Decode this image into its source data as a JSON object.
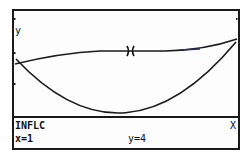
{
  "screen": {
    "axis_labels": {
      "y": "y",
      "x": "X"
    },
    "mode_label": "INFLC",
    "readout": {
      "x": "x=1",
      "y": "y=4"
    },
    "cursor_symbol": "X"
  },
  "colors": {
    "ink": "#1a1a1a",
    "accent": "#2a2a6a",
    "background": "#fdfdfd"
  }
}
